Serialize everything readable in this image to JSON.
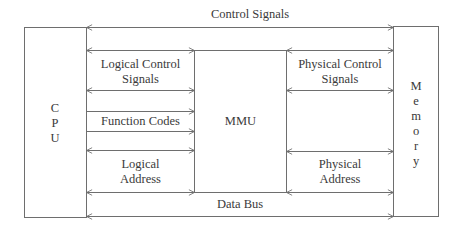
{
  "diagram": {
    "colors": {
      "line": "#6e6e6e",
      "text": "#3a3a3a",
      "background": "#ffffff"
    },
    "blocks": {
      "cpu": {
        "label": "CPU",
        "letters": [
          "C",
          "P",
          "U"
        ]
      },
      "mmu": {
        "label": "MMU"
      },
      "memory": {
        "label": "Memory",
        "letters": [
          "M",
          "e",
          "m",
          "o",
          "r",
          "y"
        ]
      }
    },
    "signals": {
      "control_signals": {
        "label": "Control Signals",
        "direction": "bidirectional"
      },
      "logical_control_signals": {
        "line1": "Logical Control",
        "line2": "Signals",
        "direction": "bidirectional"
      },
      "function_codes": {
        "label": "Function Codes",
        "direction": "cpu-to-mmu"
      },
      "logical_address": {
        "line1": "Logical",
        "line2": "Address",
        "direction": "bidirectional"
      },
      "physical_control_signals": {
        "line1": "Physical Control",
        "line2": "Signals",
        "direction": "bidirectional"
      },
      "physical_address": {
        "line1": "Physical",
        "line2": "Address",
        "direction": "bidirectional"
      },
      "data_bus": {
        "label": "Data Bus",
        "direction": "bidirectional"
      }
    }
  }
}
